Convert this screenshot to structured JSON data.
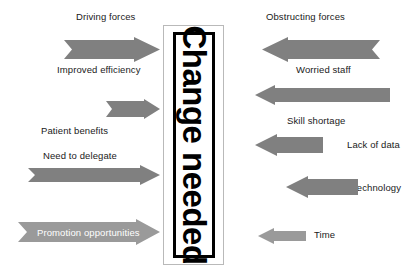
{
  "diagram": {
    "center": {
      "text": "Change needed",
      "orientation": "vertical-top-to-bottom"
    },
    "headings": {
      "left": "Driving forces",
      "right": "Obstructing forces"
    },
    "colors": {
      "arrow_fill": "#808080",
      "arrow_fill_light": "#9a9a9a",
      "text": "#1a1a1a",
      "inside_text": "#ffffff",
      "box_border": "#000000",
      "outer_box_border": "#b9b9b9",
      "background": "#ffffff"
    },
    "driving_forces": [
      {
        "label": "Improved efficiency",
        "direction": "right",
        "shape": "notched-tail",
        "label_position": "below"
      },
      {
        "label": "Patient benefits",
        "direction": "right",
        "shape": "notched-tail",
        "label_position": "below"
      },
      {
        "label": "Need to delegate",
        "direction": "right",
        "shape": "notched-tail",
        "label_position": "above"
      },
      {
        "label": "Promotion opportunities",
        "direction": "right",
        "shape": "notched-tail",
        "label_position": "inside"
      }
    ],
    "obstructing_forces": [
      {
        "label": "Worried staff",
        "direction": "left",
        "shape": "notched-tail",
        "label_position": "below"
      },
      {
        "label": "Skill shortage",
        "direction": "left",
        "shape": "flat-tail",
        "label_position": "below"
      },
      {
        "label": "Lack of data",
        "direction": "left",
        "shape": "flat-tail",
        "label_position": "right"
      },
      {
        "label": "Technology",
        "direction": "left",
        "shape": "flat-tail",
        "label_position": "right"
      },
      {
        "label": "Time",
        "direction": "left",
        "shape": "flat-tail",
        "label_position": "right"
      }
    ]
  }
}
